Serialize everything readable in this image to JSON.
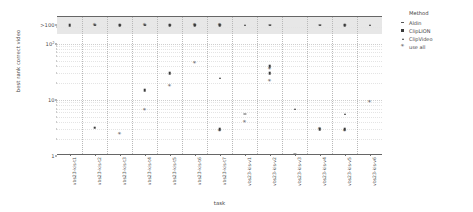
{
  "chart_data": {
    "type": "scatter",
    "title": "",
    "xlabel": "task",
    "ylabel": "best rank correct video",
    "yscale": "log",
    "ylim": [
      1,
      300
    ],
    "grid": true,
    "legend_position": "right",
    "legend_title": "Method",
    "y_ticks": [
      {
        "value": 1,
        "label": "1"
      },
      {
        "value": 10,
        "label": "10"
      },
      {
        "value": 100,
        "label": "10",
        "exponent": "2"
      },
      {
        "value": 215,
        "label": ">100"
      }
    ],
    "bands": [
      {
        "label": ">100",
        "from": 150,
        "to": 300,
        "color": "#d9d9d9"
      }
    ],
    "categories": [
      "vbs23-kis-t1",
      "vbs23-kis-t2",
      "vbs23-kis-t3",
      "vbs23-kis-t4",
      "vbs23-kis-t5",
      "vbs23-kis-t6",
      "vbs23-kis-t7",
      "vbs23-kis-v1",
      "vbs23-kis-v2",
      "vbs23-kis-v3",
      "vbs23-kis-v4",
      "vbs23-kis-v5",
      "vbs23-kis-v6"
    ],
    "series": [
      {
        "name": "Aldin",
        "marker": "dash",
        "points": [
          {
            "category": 0,
            "value": 1
          },
          {
            "category": 1,
            "value": 215
          },
          {
            "category": 2,
            "value": 215
          },
          {
            "category": 3,
            "value": 215
          },
          {
            "category": 4,
            "value": 215
          },
          {
            "category": 5,
            "value": 215
          },
          {
            "category": 6,
            "value": 215
          },
          {
            "category": 7,
            "value": 5.5
          },
          {
            "category": 8,
            "value": 215
          },
          {
            "category": 9,
            "value": 1.1
          },
          {
            "category": 10,
            "value": 215
          },
          {
            "category": 11,
            "value": 215
          },
          {
            "category": 12,
            "value": 1
          }
        ]
      },
      {
        "name": "ClipLION",
        "marker": "square",
        "points": [
          {
            "category": 0,
            "value": 1
          },
          {
            "category": 0,
            "value": 215
          },
          {
            "category": 1,
            "value": 1
          },
          {
            "category": 1,
            "value": 3.2
          },
          {
            "category": 2,
            "value": 1
          },
          {
            "category": 2,
            "value": 215
          },
          {
            "category": 3,
            "value": 15
          },
          {
            "category": 4,
            "value": 30
          },
          {
            "category": 4,
            "value": 215
          },
          {
            "category": 5,
            "value": 215
          },
          {
            "category": 6,
            "value": 215
          },
          {
            "category": 6,
            "value": 3
          },
          {
            "category": 7,
            "value": 1
          },
          {
            "category": 8,
            "value": 40
          },
          {
            "category": 8,
            "value": 30
          },
          {
            "category": 9,
            "value": 1
          },
          {
            "category": 10,
            "value": 3
          },
          {
            "category": 11,
            "value": 3
          },
          {
            "category": 11,
            "value": 215
          },
          {
            "category": 12,
            "value": 1
          }
        ]
      },
      {
        "name": "ClipVideo",
        "marker": "triangle",
        "points": [
          {
            "category": 1,
            "value": 215
          },
          {
            "category": 2,
            "value": 215
          },
          {
            "category": 3,
            "value": 215
          },
          {
            "category": 4,
            "value": 215
          },
          {
            "category": 5,
            "value": 215
          },
          {
            "category": 6,
            "value": 25
          },
          {
            "category": 7,
            "value": 215
          },
          {
            "category": 8,
            "value": 215
          },
          {
            "category": 9,
            "value": 7
          },
          {
            "category": 10,
            "value": 215
          },
          {
            "category": 11,
            "value": 5.5
          },
          {
            "category": 12,
            "value": 215
          }
        ]
      },
      {
        "name": "use all",
        "marker": "star",
        "points": [
          {
            "category": 0,
            "value": 1
          },
          {
            "category": 1,
            "value": 215
          },
          {
            "category": 2,
            "value": 2.5
          },
          {
            "category": 3,
            "value": 215
          },
          {
            "category": 3,
            "value": 6.5
          },
          {
            "category": 4,
            "value": 18
          },
          {
            "category": 5,
            "value": 215
          },
          {
            "category": 5,
            "value": 45
          },
          {
            "category": 6,
            "value": 215
          },
          {
            "category": 6,
            "value": 2.8
          },
          {
            "category": 7,
            "value": 4
          },
          {
            "category": 8,
            "value": 22
          },
          {
            "category": 8,
            "value": 35
          },
          {
            "category": 9,
            "value": 1
          },
          {
            "category": 10,
            "value": 3
          },
          {
            "category": 11,
            "value": 2.8
          },
          {
            "category": 12,
            "value": 9
          }
        ]
      }
    ]
  },
  "legend": {
    "title": "Method",
    "items": [
      {
        "label": "Aldin",
        "marker": "dash"
      },
      {
        "label": "ClipLION",
        "marker": "square"
      },
      {
        "label": "ClipVideo",
        "marker": "triangle"
      },
      {
        "label": "use all",
        "marker": "star"
      }
    ]
  }
}
